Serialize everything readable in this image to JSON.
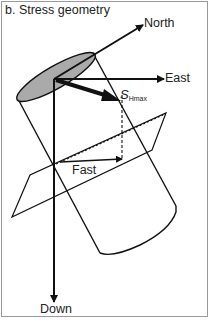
{
  "figure": {
    "title": "b. Stress geometry",
    "labels": {
      "north": "North",
      "east": "East",
      "down": "Down",
      "fast": "Fast",
      "shmax_main": "S",
      "shmax_sub": "Hmax"
    },
    "colors": {
      "stroke": "#111111",
      "ellipse_fill": "#aaaaaa",
      "frame": "#9a9a9a",
      "background": "#ffffff"
    },
    "elements": [
      "north-axis-arrow",
      "east-axis-arrow",
      "down-axis-arrow",
      "shmax-arrow",
      "borehole-cylinder",
      "cylinder-top-ellipse",
      "shear-plane",
      "fast-direction-arrow",
      "projection-dashed-lines"
    ]
  }
}
